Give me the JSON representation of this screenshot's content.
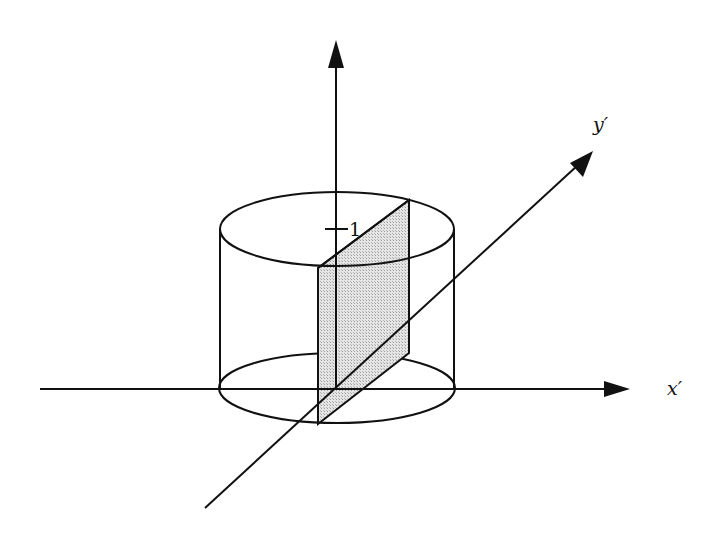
{
  "diagram": {
    "type": "3d-coordinate-sketch",
    "colors": {
      "stroke": "#111111",
      "plane_fill": "#d9d9d9",
      "background": "#ffffff"
    },
    "axes": {
      "x_prime": {
        "label": "x′"
      },
      "y_prime": {
        "label": "y′"
      },
      "vertical": {
        "label": ""
      }
    },
    "tick": {
      "label": "1",
      "axis": "vertical"
    }
  }
}
